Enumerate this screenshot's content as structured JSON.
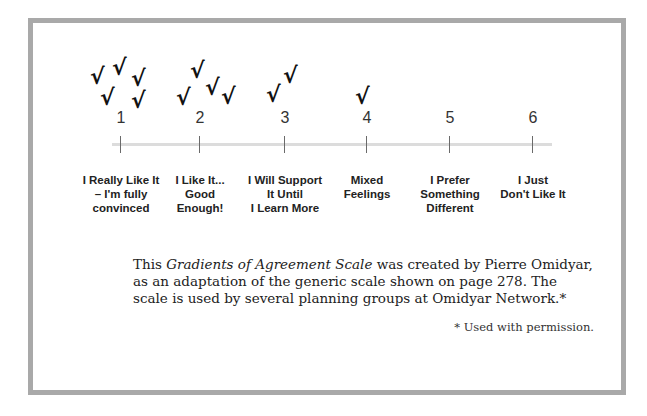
{
  "diagram": {
    "title": "Gradients of Agreement Scale",
    "scale_points": [
      {
        "number": "1",
        "label": "I Really Like It\n– I'm fully\nconvinced",
        "checks": 6
      },
      {
        "number": "2",
        "label": "I Like It...\nGood\nEnough!",
        "checks": 4
      },
      {
        "number": "3",
        "label": "I Will Support\nIt Until\nI Learn More",
        "checks": 2
      },
      {
        "number": "4",
        "label": "Mixed\nFeelings",
        "checks": 1
      },
      {
        "number": "5",
        "label": "I Prefer\nSomething\nDifferent",
        "checks": 0
      },
      {
        "number": "6",
        "label": "I Just\nDon't Like It",
        "checks": 0
      }
    ],
    "check_glyph": "√",
    "check_icon": "checkmark-vote-icon"
  },
  "caption": {
    "prefix": "This ",
    "italic": "Gradients of Agreement Scale",
    "line1_rest": " was created by Pierre Omidyar,",
    "line2": "as an adaptation of the generic scale shown on page 278.  The",
    "line3": "scale is used by several planning groups at Omidyar Network.*"
  },
  "footnote": "* Used with permission.",
  "colors": {
    "frame_border": "#a9a9a9",
    "scale_line": "#dcdcdc",
    "text": "#222222"
  }
}
